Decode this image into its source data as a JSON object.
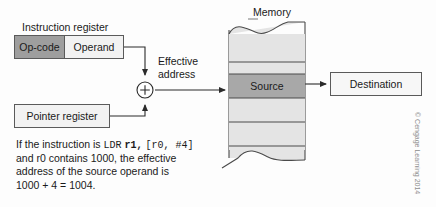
{
  "figure": {
    "instruction_register": {
      "caption": "Instruction register",
      "opcode_label": "Op-code",
      "operand_label": "Operand"
    },
    "pointer_register": {
      "label": "Pointer register"
    },
    "adder": {
      "symbol": "+"
    },
    "effective_address": {
      "line1": "Effective",
      "line2": "address"
    },
    "memory": {
      "caption": "Memory",
      "source_label": "Source",
      "cells": [
        {
          "label": "",
          "type": "plain"
        },
        {
          "label": "",
          "type": "plain"
        },
        {
          "label": "Source",
          "type": "source"
        },
        {
          "label": "",
          "type": "plain"
        },
        {
          "label": "",
          "type": "plain"
        }
      ]
    },
    "destination": {
      "label": "Destination"
    },
    "explanation": {
      "part1": "If the instruction is ",
      "code1": "LDR",
      "code2": "r1,",
      "code3": "[r0, #4]",
      "part2": "and r0 contains 1000, the effective",
      "part3": "address of the source operand is",
      "part4": "1000 + 4 = 1004."
    },
    "copyright": "© Cengage Learning 2014",
    "colors": {
      "opcode_fill": "#9e9e9e",
      "operand_fill": "#f2f2f2",
      "memory_fill": "#e4e4e4",
      "source_fill": "#a8a8a8",
      "line": "#4a4a4a"
    }
  }
}
